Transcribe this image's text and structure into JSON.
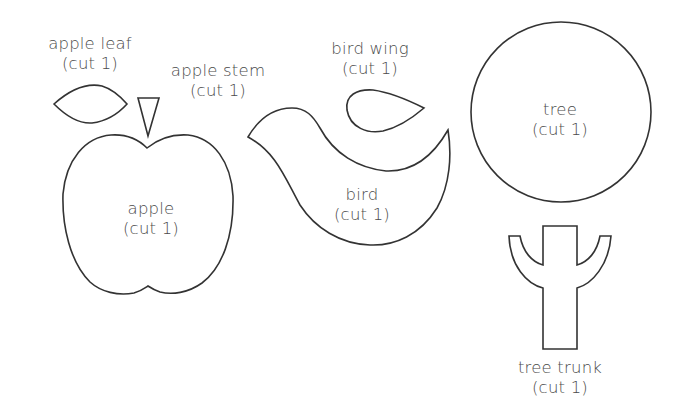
{
  "template": {
    "pieces": [
      {
        "id": "apple-leaf",
        "name": "apple leaf",
        "quantity": "(cut 1)"
      },
      {
        "id": "apple-stem",
        "name": "apple stem",
        "quantity": "(cut 1)"
      },
      {
        "id": "apple",
        "name": "apple",
        "quantity": "(cut 1)"
      },
      {
        "id": "bird-wing",
        "name": "bird wing",
        "quantity": "(cut 1)"
      },
      {
        "id": "bird",
        "name": "bird",
        "quantity": "(cut 1)"
      },
      {
        "id": "tree",
        "name": "tree",
        "quantity": "(cut 1)"
      },
      {
        "id": "tree-trunk",
        "name": "tree trunk",
        "quantity": "(cut 1)"
      }
    ],
    "colors": {
      "outline": "#333333",
      "text": "#4a4a4a",
      "background": "#ffffff"
    }
  }
}
